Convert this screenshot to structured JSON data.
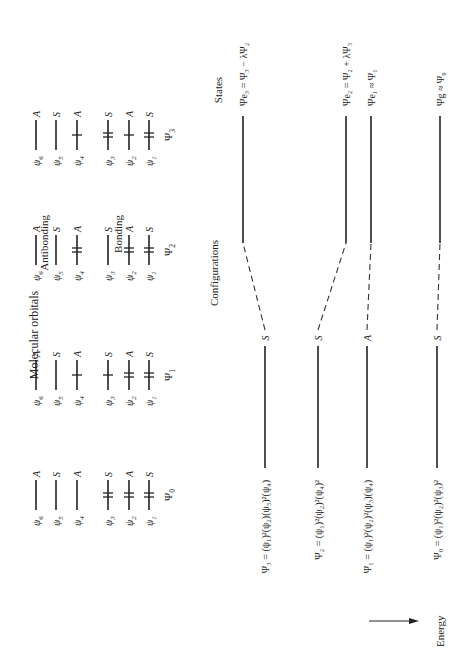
{
  "title": "Molecular orbitals",
  "sections": {
    "configurations_label": "Configurations",
    "states_label": "States",
    "energy_label": "Energy",
    "antibonding_label": "Antibonding",
    "bonding_label": "Bonding"
  },
  "mo_sets": [
    {
      "name": "Ψ",
      "sub": "0",
      "orbitals": [
        {
          "label": "ψ",
          "sub": "6",
          "sym": "A",
          "electrons": 0
        },
        {
          "label": "ψ",
          "sub": "5",
          "sym": "S",
          "electrons": 0
        },
        {
          "label": "ψ",
          "sub": "4",
          "sym": "A",
          "electrons": 0
        },
        {
          "label": "ψ",
          "sub": "3",
          "sym": "S",
          "electrons": 2
        },
        {
          "label": "ψ",
          "sub": "2",
          "sym": "A",
          "electrons": 2
        },
        {
          "label": "ψ",
          "sub": "1",
          "sym": "S",
          "electrons": 2
        }
      ]
    },
    {
      "name": "Ψ",
      "sub": "1",
      "orbitals": [
        {
          "label": "ψ",
          "sub": "6",
          "sym": "A",
          "electrons": 0
        },
        {
          "label": "ψ",
          "sub": "5",
          "sym": "S",
          "electrons": 0
        },
        {
          "label": "ψ",
          "sub": "4",
          "sym": "A",
          "electrons": 1
        },
        {
          "label": "ψ",
          "sub": "3",
          "sym": "S",
          "electrons": 1
        },
        {
          "label": "ψ",
          "sub": "2",
          "sym": "A",
          "electrons": 2
        },
        {
          "label": "ψ",
          "sub": "1",
          "sym": "S",
          "electrons": 2
        }
      ]
    },
    {
      "name": "Ψ",
      "sub": "2",
      "orbitals": [
        {
          "label": "ψ",
          "sub": "6",
          "sym": "A",
          "electrons": 0
        },
        {
          "label": "ψ",
          "sub": "5",
          "sym": "S",
          "electrons": 0
        },
        {
          "label": "ψ",
          "sub": "4",
          "sym": "A",
          "electrons": 2
        },
        {
          "label": "ψ",
          "sub": "3",
          "sym": "S",
          "electrons": 0
        },
        {
          "label": "ψ",
          "sub": "2",
          "sym": "A",
          "electrons": 2
        },
        {
          "label": "ψ",
          "sub": "1",
          "sym": "S",
          "electrons": 2
        }
      ]
    },
    {
      "name": "Ψ",
      "sub": "3",
      "orbitals": [
        {
          "label": "ψ",
          "sub": "6",
          "sym": "A",
          "electrons": 0
        },
        {
          "label": "ψ",
          "sub": "5",
          "sym": "S",
          "electrons": 0
        },
        {
          "label": "ψ",
          "sub": "4",
          "sym": "A",
          "electrons": 1
        },
        {
          "label": "ψ",
          "sub": "3",
          "sym": "S",
          "electrons": 2
        },
        {
          "label": "ψ",
          "sub": "2",
          "sym": "A",
          "electrons": 1
        },
        {
          "label": "ψ",
          "sub": "1",
          "sym": "S",
          "electrons": 2
        }
      ]
    }
  ],
  "configurations": [
    {
      "id": "psi3",
      "text": "Ψ₃ = (ψ₁)²(ψ₂)(ψ₃)²(ψ₄)",
      "sym": "S"
    },
    {
      "id": "psi2",
      "text": "Ψ₂ = (ψ₁)²(ψ₂)²(ψ₄)²",
      "sym": "S"
    },
    {
      "id": "psi1",
      "text": "Ψ₁ = (ψ₁)²(ψ₂)²(ψ₃)(ψ₄)",
      "sym": "A"
    },
    {
      "id": "psi0",
      "text": "Ψ₀ = (ψ₁)²(ψ₂)²(ψ₃)²",
      "sym": "S"
    }
  ],
  "states": [
    {
      "id": "e3",
      "text": "Ψe₃ = Ψ₃ − λΨ₂",
      "connects_to": "psi3"
    },
    {
      "id": "e2",
      "text": "Ψe₂ = Ψ₂ + λΨ₃",
      "connects_to": "psi2"
    },
    {
      "id": "e1",
      "text": "Ψe₁ ≈ Ψ₁",
      "connects_to": "psi1"
    },
    {
      "id": "g",
      "text": "Ψg ≈ Ψ₀",
      "connects_to": "psi0"
    }
  ]
}
